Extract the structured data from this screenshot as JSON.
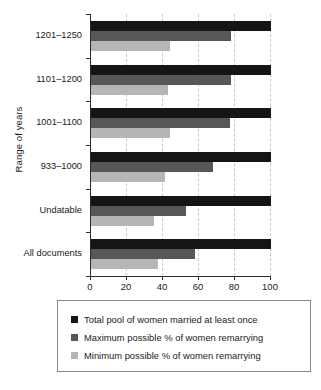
{
  "chart_data": {
    "type": "bar",
    "orientation": "horizontal",
    "title": "",
    "xlabel": "",
    "ylabel": "Range of years",
    "xlim": [
      0,
      100
    ],
    "xticks": [
      0,
      20,
      40,
      60,
      80,
      100
    ],
    "xtick_labels": [
      "0",
      "20",
      "40",
      "60",
      "80",
      "100"
    ],
    "grid": true,
    "grid_axis": "x",
    "legend_position": "below",
    "categories": [
      "1201–1250",
      "1101–1200",
      "1001–1100",
      "933–1000",
      "Undatable",
      "All documents"
    ],
    "series": [
      {
        "name": "Total pool of women married at least once",
        "color": "#151515",
        "values": [
          100,
          100,
          100,
          100,
          100,
          100
        ]
      },
      {
        "name": "Maximum possible % of women remarrying",
        "color": "#575757",
        "values": [
          78,
          78,
          77,
          68,
          53,
          58
        ]
      },
      {
        "name": "Minimum possible % of women remarrying",
        "color": "#b6b6b6",
        "values": [
          44,
          43,
          44,
          41,
          35,
          37
        ]
      }
    ]
  }
}
